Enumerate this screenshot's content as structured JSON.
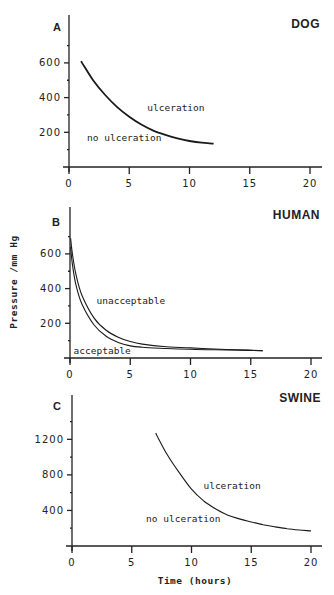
{
  "figure": {
    "ylabel": "Pressure /mm Hg",
    "xlabel": "Time (hours)"
  },
  "chart_data": [
    {
      "type": "line",
      "panel": "A",
      "title": "DOG",
      "xlabel": "",
      "ylabel": "",
      "xlim": [
        0,
        20
      ],
      "ylim": [
        0,
        800
      ],
      "xticks": [
        0,
        5,
        10,
        15,
        20
      ],
      "yticks": [
        200,
        400,
        600
      ],
      "grid": false,
      "annotations": [
        {
          "text": "ulceration",
          "x": 6.5,
          "y": 320
        },
        {
          "text": "no ulceration",
          "x": 1.5,
          "y": 150
        }
      ],
      "series": [
        {
          "name": "ulceration threshold",
          "x": [
            1,
            2,
            3,
            4,
            5,
            6,
            7,
            8,
            9,
            10,
            11,
            12
          ],
          "y": [
            610,
            500,
            415,
            345,
            290,
            245,
            210,
            185,
            165,
            150,
            140,
            135
          ]
        }
      ]
    },
    {
      "type": "line",
      "panel": "B",
      "title": "HUMAN",
      "xlabel": "",
      "ylabel": "Pressure /mm Hg",
      "xlim": [
        0,
        20
      ],
      "ylim": [
        0,
        800
      ],
      "xticks": [
        0,
        5,
        10,
        15,
        20
      ],
      "yticks": [
        200,
        400,
        600
      ],
      "grid": false,
      "annotations": [
        {
          "text": "unacceptable",
          "x": 2.2,
          "y": 310
        },
        {
          "text": "acceptable",
          "x": 0.3,
          "y": 25
        }
      ],
      "series": [
        {
          "name": "upper limit",
          "x": [
            0.05,
            0.2,
            0.5,
            1,
            2,
            3,
            4,
            5,
            6,
            8,
            10,
            12,
            14,
            16
          ],
          "y": [
            690,
            600,
            480,
            360,
            230,
            160,
            120,
            95,
            80,
            65,
            58,
            52,
            47,
            42
          ]
        },
        {
          "name": "lower limit",
          "x": [
            0.05,
            0.2,
            0.5,
            1,
            2,
            3,
            4,
            5,
            6,
            8,
            10,
            12,
            14,
            16
          ],
          "y": [
            640,
            540,
            420,
            310,
            190,
            125,
            90,
            70,
            62,
            55,
            50,
            47,
            45,
            42
          ]
        }
      ]
    },
    {
      "type": "line",
      "panel": "C",
      "title": "SWINE",
      "xlabel": "Time (hours)",
      "ylabel": "",
      "xlim": [
        0,
        20
      ],
      "ylim": [
        0,
        1600
      ],
      "xticks": [
        0,
        5,
        10,
        15,
        20
      ],
      "yticks": [
        400,
        800,
        1200
      ],
      "grid": false,
      "annotations": [
        {
          "text": "ulceration",
          "x": 11,
          "y": 640
        },
        {
          "text": "no ulceration",
          "x": 6.2,
          "y": 270
        }
      ],
      "series": [
        {
          "name": "ulceration threshold",
          "x": [
            7,
            8,
            9,
            10,
            11,
            12,
            13,
            14,
            15,
            16,
            17,
            18,
            19,
            20
          ],
          "y": [
            1270,
            1020,
            820,
            640,
            510,
            420,
            350,
            305,
            270,
            240,
            215,
            195,
            180,
            170
          ]
        }
      ]
    }
  ],
  "layout": {
    "panels": [
      {
        "x0": 69,
        "x20": 310,
        "ybase": 167,
        "ytop": 15,
        "ymax_px_per_unit": 0.1735,
        "axis_right": 322,
        "letter_pos": [
          57,
          31
        ],
        "title_pos": [
          320,
          28
        ],
        "smooth_stroke": 1.8
      },
      {
        "x0": 70,
        "x20": 311,
        "ybase": 358,
        "ytop": 207,
        "ymax_px_per_unit": 0.1735,
        "axis_right": 322,
        "letter_pos": [
          56,
          226
        ],
        "title_pos": [
          320,
          219
        ],
        "smooth_stroke": 1.1
      },
      {
        "x0": 72,
        "x20": 311,
        "ybase": 546,
        "ytop": 395,
        "ymax_px_per_unit": 0.0889,
        "axis_right": 322,
        "letter_pos": [
          57,
          410
        ],
        "title_pos": [
          321,
          402
        ],
        "smooth_stroke": 1.1
      }
    ],
    "ylabel_pos": [
      17,
      282
    ],
    "xlabel_pos": [
      195,
      584
    ]
  }
}
